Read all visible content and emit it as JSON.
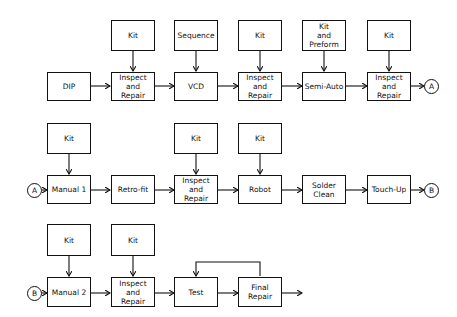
{
  "rows": [
    {
      "inputs": [
        "Kit",
        "Sequence",
        "Kit",
        "Kit\nand\nPreform",
        "Kit"
      ],
      "steps": [
        "DIP",
        "Inspect\nand\nRepair",
        "VCD",
        "Inspect\nand\nRepair",
        "Semi-Auto",
        "Inspect\nand\nRepair"
      ],
      "end_connector": "A"
    },
    {
      "start_connector": "A",
      "inputs": [
        "Kit",
        "Kit",
        "Kit"
      ],
      "steps": [
        "Manual 1",
        "Retro-fit",
        "Inspect\nand\nRepair",
        "Robot",
        "Solder\nClean",
        "Touch-Up"
      ],
      "end_connector": "B"
    },
    {
      "start_connector": "B",
      "inputs": [
        "Kit",
        "Kit"
      ],
      "steps": [
        "Manual 2",
        "Inspect\nand\nRepair",
        "Test",
        "Final\nRepair"
      ]
    }
  ]
}
